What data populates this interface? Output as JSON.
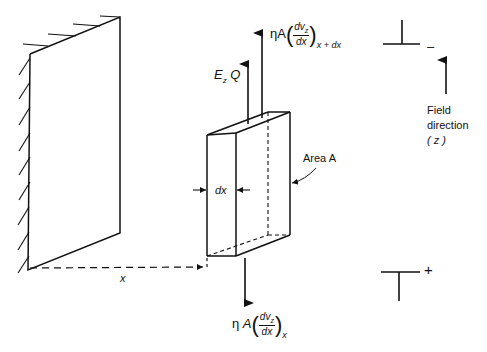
{
  "diagram": {
    "type": "physics-free-body-diagram",
    "labels": {
      "force_top": {
        "eta": "η",
        "A": "A",
        "num": "dv",
        "num_sub": "z",
        "den": "dx",
        "subscript": "x + dx"
      },
      "force_bottom": {
        "eta": "η",
        "A": "A",
        "num": "dv",
        "num_sub": "z",
        "den": "dx",
        "subscript": "x"
      },
      "electric_force": {
        "E": "E",
        "E_sub": "z",
        "Q": "Q"
      },
      "thickness": "dx",
      "area": "Area A",
      "distance": "x",
      "field": {
        "line1": "Field",
        "line2": "direction",
        "line3": "( z )"
      },
      "plate_top_sign": "–",
      "plate_bottom_sign": "+"
    },
    "colors": {
      "ink": "#111111",
      "background": "#ffffff"
    }
  }
}
